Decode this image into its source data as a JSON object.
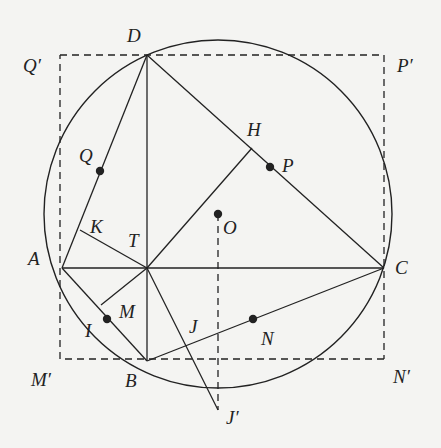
{
  "diagram": {
    "type": "geometry",
    "colors": {
      "background": "#f4f4f2",
      "stroke": "#222222"
    },
    "circle": {
      "center": "O",
      "cx": 218,
      "cy": 214,
      "r": 174
    },
    "points": {
      "D": {
        "label": "D",
        "x": 147,
        "y": 55,
        "lx": 127,
        "ly": 42
      },
      "A": {
        "label": "A",
        "x": 62,
        "y": 268,
        "lx": 28,
        "ly": 265
      },
      "C": {
        "label": "C",
        "x": 384,
        "y": 268,
        "lx": 395,
        "ly": 274
      },
      "B": {
        "label": "B",
        "x": 147,
        "y": 361,
        "lx": 125,
        "ly": 387
      },
      "T": {
        "label": "T",
        "x": 147,
        "y": 268,
        "lx": 128,
        "ly": 247
      },
      "O": {
        "label": "O",
        "x": 218,
        "y": 214,
        "lx": 223,
        "ly": 234
      },
      "H": {
        "label": "H",
        "x": 252,
        "y": 148,
        "lx": 247,
        "ly": 136
      },
      "P": {
        "label": "P",
        "x": 270,
        "y": 167,
        "lx": 282,
        "ly": 172
      },
      "Q": {
        "label": "Q",
        "x": 100,
        "y": 171,
        "lx": 79,
        "ly": 162
      },
      "K": {
        "label": "K",
        "x": 80,
        "y": 230,
        "lx": 90,
        "ly": 233
      },
      "M": {
        "label": "M",
        "x": 107,
        "y": 319,
        "lx": 119,
        "ly": 318
      },
      "I": {
        "label": "I",
        "x": 101,
        "y": 305,
        "lx": 85,
        "ly": 337
      },
      "J": {
        "label": "J",
        "x": 200,
        "y": 330,
        "lx": 189,
        "ly": 333
      },
      "N": {
        "label": "N",
        "x": 253,
        "y": 319,
        "lx": 261,
        "ly": 345
      },
      "Qp": {
        "label": "Q′",
        "x": 60,
        "y": 55,
        "lx": 23,
        "ly": 72
      },
      "Pp": {
        "label": "P′",
        "x": 384,
        "y": 55,
        "lx": 397,
        "ly": 72
      },
      "Mp": {
        "label": "M′",
        "x": 60,
        "y": 359,
        "lx": 31,
        "ly": 386
      },
      "Np": {
        "label": "N′",
        "x": 384,
        "y": 359,
        "lx": 393,
        "ly": 383
      },
      "Jp": {
        "label": "J′",
        "x": 218,
        "y": 410,
        "lx": 226,
        "ly": 424
      }
    },
    "dots": [
      "Q",
      "P",
      "O",
      "M",
      "N"
    ],
    "solid_segments": [
      [
        "D",
        "A"
      ],
      [
        "D",
        "C"
      ],
      [
        "D",
        "B"
      ],
      [
        "A",
        "C"
      ],
      [
        "A",
        "B"
      ],
      [
        "B",
        "C"
      ],
      [
        "K",
        "T"
      ],
      [
        "T",
        "H"
      ],
      [
        "T",
        "I"
      ],
      [
        "T",
        "Jp"
      ]
    ],
    "dashed_segments": [
      [
        "Qp",
        "Pp"
      ],
      [
        "Pp",
        "Np"
      ],
      [
        "Np",
        "Mp"
      ],
      [
        "Mp",
        "Qp"
      ],
      [
        "O",
        "Jp"
      ]
    ]
  }
}
